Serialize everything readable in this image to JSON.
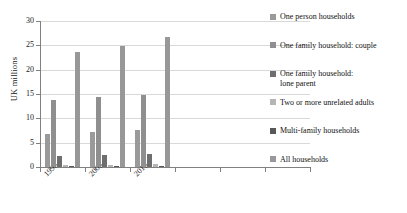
{
  "chart_data": {
    "type": "bar",
    "title": "",
    "xlabel": "",
    "ylabel": "UK millions",
    "ylim": [
      0,
      30
    ],
    "yticks": [
      0,
      5,
      10,
      15,
      20,
      25,
      30
    ],
    "grid": true,
    "legend_position": "right",
    "categories": [
      "1996",
      "2005",
      "2015",
      "",
      "",
      ""
    ],
    "series": [
      {
        "name": "One person households",
        "color": "#9a9a9a",
        "values": [
          6.7,
          7.2,
          7.6,
          null,
          null,
          null
        ]
      },
      {
        "name": "One family household: couple",
        "color": "#8f8f8f",
        "values": [
          13.8,
          14.3,
          14.7,
          null,
          null,
          null
        ]
      },
      {
        "name": "One family household:\nlone parent",
        "color": "#6e6e6e",
        "values": [
          2.3,
          2.5,
          2.7,
          null,
          null,
          null
        ]
      },
      {
        "name": "Two or more unrelated adults",
        "color": "#b5b5b5",
        "values": [
          0.4,
          0.5,
          0.7,
          null,
          null,
          null
        ]
      },
      {
        "name": "Multi-family households",
        "color": "#585858",
        "values": [
          0.2,
          0.2,
          0.3,
          null,
          null,
          null
        ]
      },
      {
        "name": "All households",
        "color": "#989898",
        "values": [
          23.7,
          24.8,
          26.7,
          null,
          null,
          null
        ]
      }
    ]
  },
  "axis": {
    "tick_labels_y": [
      "30",
      "25",
      "20",
      "15",
      "10",
      "5",
      "0"
    ],
    "tick_labels_x": [
      "1996",
      "2005",
      "2015"
    ],
    "y_axis_title": "UK millions"
  }
}
